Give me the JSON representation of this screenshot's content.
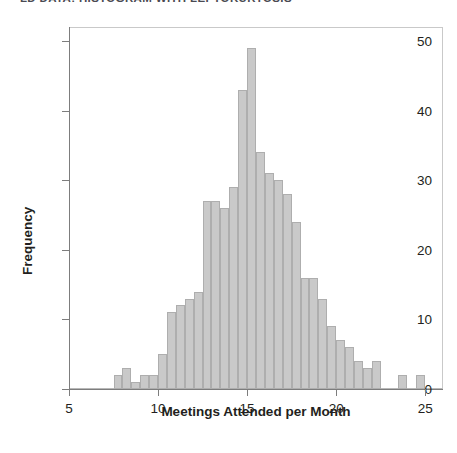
{
  "chart_data": {
    "type": "bar",
    "title": "LD DATA: HISTOGRAM WITH LEPTOKURTOSIS",
    "xlabel": "Meetings Attended per Month",
    "ylabel": "Frequency",
    "xlim": [
      5,
      26
    ],
    "ylim": [
      0,
      52
    ],
    "grid": false,
    "legend": null,
    "bin_width": 0.5,
    "bar_color": "#c9c9c9",
    "bar_edge_color": "#aeaeae",
    "x_ticks": [
      5,
      10,
      15,
      20,
      25
    ],
    "x_tick_labels": [
      "5",
      "10",
      "15",
      "20",
      "25"
    ],
    "y_ticks": [
      0,
      10,
      20,
      30,
      40,
      50
    ],
    "y_tick_labels": [
      "0",
      "10",
      "20",
      "30",
      "40",
      "50"
    ],
    "bin_starts": [
      7.5,
      8.0,
      8.5,
      9.0,
      9.5,
      10.0,
      10.5,
      11.0,
      11.5,
      12.0,
      12.5,
      13.0,
      13.5,
      14.0,
      14.5,
      15.0,
      15.5,
      16.0,
      16.5,
      17.0,
      17.5,
      18.0,
      18.5,
      19.0,
      19.5,
      20.0,
      20.5,
      21.0,
      21.5,
      22.0,
      23.5,
      24.5
    ],
    "values": [
      2,
      3,
      1,
      2,
      2,
      5,
      11,
      12,
      13,
      14,
      27,
      27,
      26,
      29,
      43,
      49,
      34,
      31,
      30,
      28,
      24,
      16,
      16,
      13,
      9,
      7,
      6,
      4,
      3,
      4,
      2,
      2
    ],
    "bars": [
      {
        "x": 7.5,
        "frequency": 2
      },
      {
        "x": 8.0,
        "frequency": 3
      },
      {
        "x": 8.5,
        "frequency": 1
      },
      {
        "x": 9.0,
        "frequency": 2
      },
      {
        "x": 9.5,
        "frequency": 2
      },
      {
        "x": 10.0,
        "frequency": 5
      },
      {
        "x": 10.5,
        "frequency": 11
      },
      {
        "x": 11.0,
        "frequency": 12
      },
      {
        "x": 11.5,
        "frequency": 13
      },
      {
        "x": 12.0,
        "frequency": 14
      },
      {
        "x": 12.5,
        "frequency": 27
      },
      {
        "x": 13.0,
        "frequency": 27
      },
      {
        "x": 13.5,
        "frequency": 26
      },
      {
        "x": 14.0,
        "frequency": 29
      },
      {
        "x": 14.5,
        "frequency": 43
      },
      {
        "x": 15.0,
        "frequency": 49
      },
      {
        "x": 15.5,
        "frequency": 34
      },
      {
        "x": 16.0,
        "frequency": 31
      },
      {
        "x": 16.5,
        "frequency": 30
      },
      {
        "x": 17.0,
        "frequency": 28
      },
      {
        "x": 17.5,
        "frequency": 24
      },
      {
        "x": 18.0,
        "frequency": 16
      },
      {
        "x": 18.5,
        "frequency": 16
      },
      {
        "x": 19.0,
        "frequency": 13
      },
      {
        "x": 19.5,
        "frequency": 9
      },
      {
        "x": 20.0,
        "frequency": 7
      },
      {
        "x": 20.5,
        "frequency": 6
      },
      {
        "x": 21.0,
        "frequency": 4
      },
      {
        "x": 21.5,
        "frequency": 3
      },
      {
        "x": 22.0,
        "frequency": 4
      },
      {
        "x": 23.5,
        "frequency": 2
      },
      {
        "x": 24.5,
        "frequency": 2
      }
    ]
  }
}
